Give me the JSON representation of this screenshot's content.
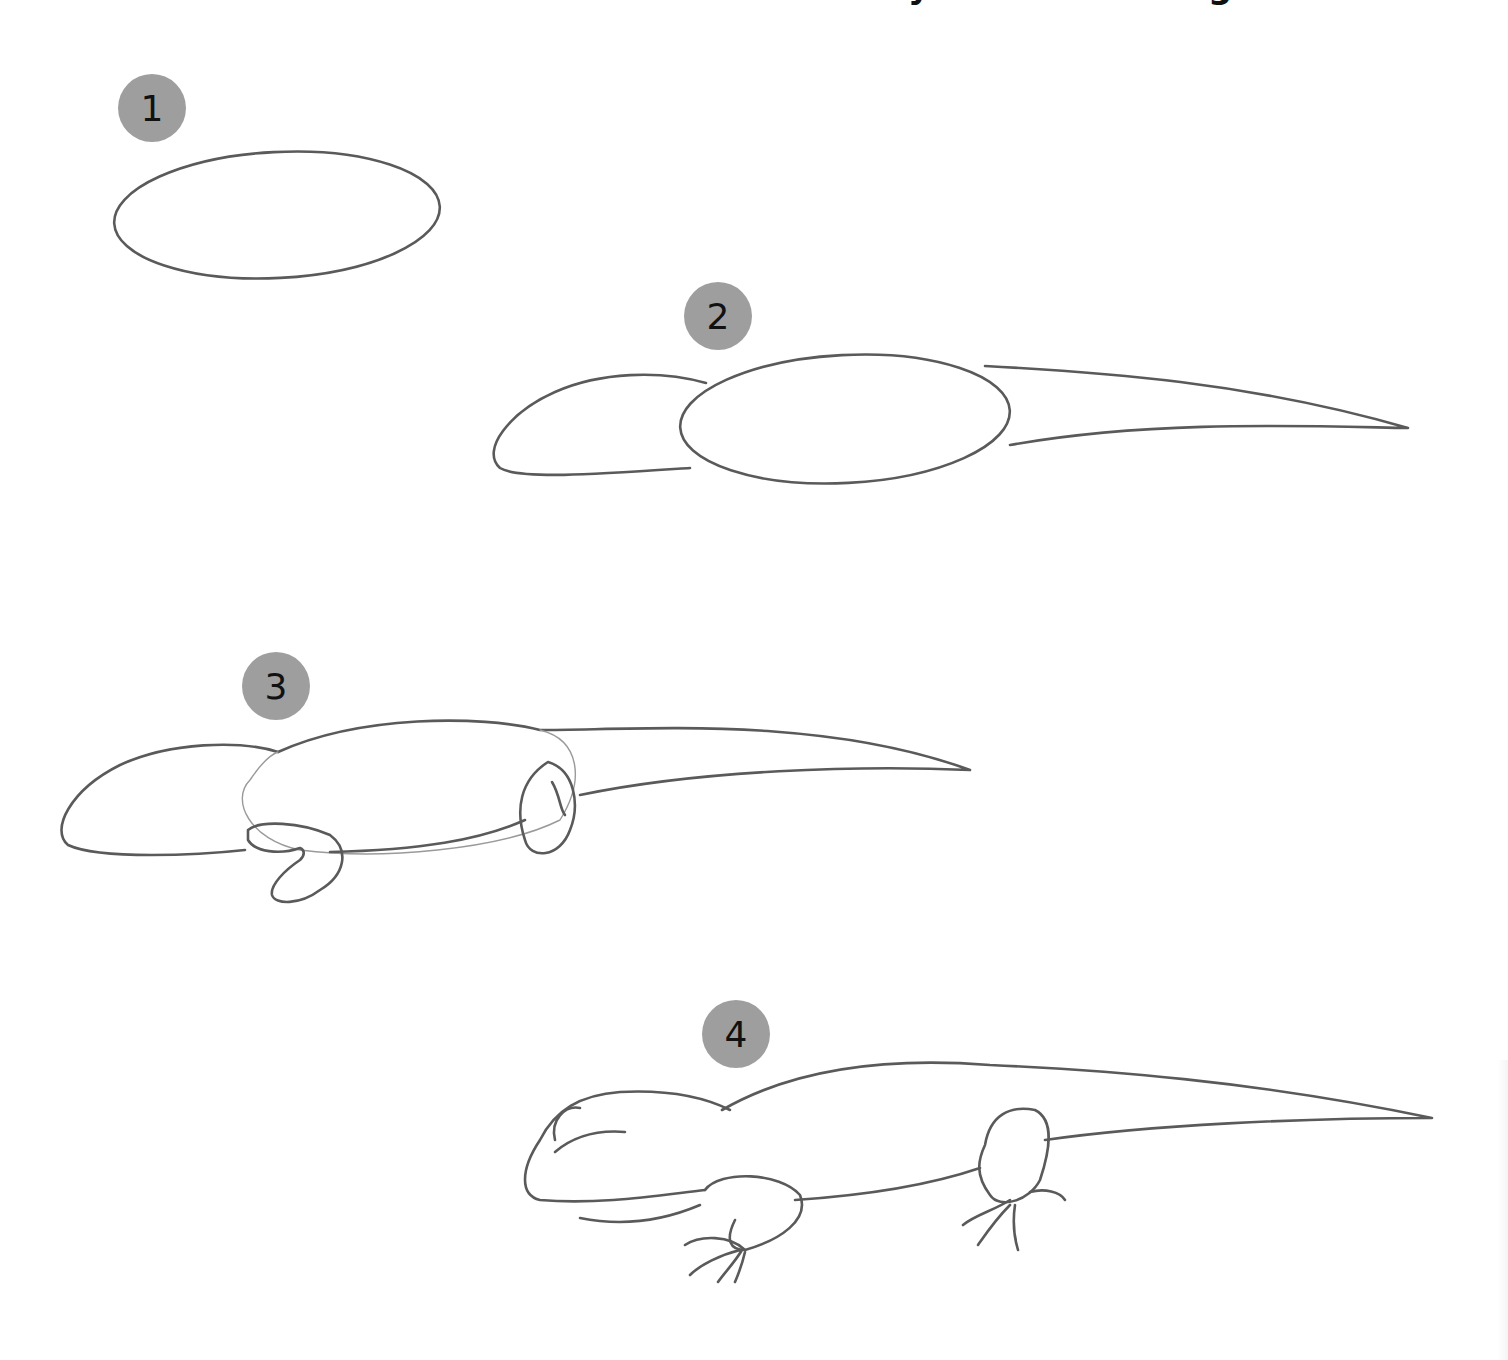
{
  "page": {
    "title_visible_fragment": "y g",
    "background": "#ffffff",
    "stroke_color": "#5a5a5a",
    "badge_color": "#9e9e9e"
  },
  "steps": [
    {
      "number": "1",
      "description": "oval body"
    },
    {
      "number": "2",
      "description": "head oval, body oval and tapering tail"
    },
    {
      "number": "3",
      "description": "add front and back legs"
    },
    {
      "number": "4",
      "description": "finished lizard outline with eye, toes and claws"
    }
  ]
}
